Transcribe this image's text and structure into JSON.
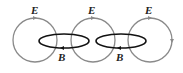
{
  "diagram": {
    "colors": {
      "e_field": "#8a8a8a",
      "b_field": "#111111",
      "label": "#222222"
    },
    "e_loops": [
      {
        "label": "E",
        "cx": 35,
        "cy": 40,
        "r": 22,
        "label_x": 35,
        "label_y": 14
      },
      {
        "label": "E",
        "cx": 93,
        "cy": 40,
        "r": 22,
        "label_x": 92,
        "label_y": 14
      },
      {
        "label": "E",
        "cx": 150,
        "cy": 40,
        "r": 22,
        "label_x": 149,
        "label_y": 14
      }
    ],
    "b_loops": [
      {
        "label": "B",
        "cx": 64,
        "cy": 41,
        "rx": 25,
        "ry": 7,
        "label_x": 62,
        "label_y": 60
      },
      {
        "label": "B",
        "cx": 121,
        "cy": 41,
        "rx": 25,
        "ry": 7,
        "label_x": 120,
        "label_y": 60
      }
    ]
  }
}
